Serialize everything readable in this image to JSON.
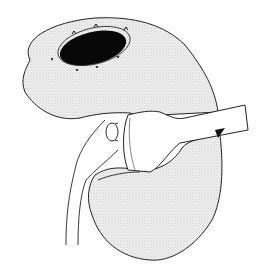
{
  "figure": {
    "type": "medical line illustration",
    "caption": "",
    "colors": {
      "background": "#ffffff",
      "stipple": "#e4e4e4",
      "outline": "#222222",
      "opening": "#080808"
    },
    "labels": []
  }
}
